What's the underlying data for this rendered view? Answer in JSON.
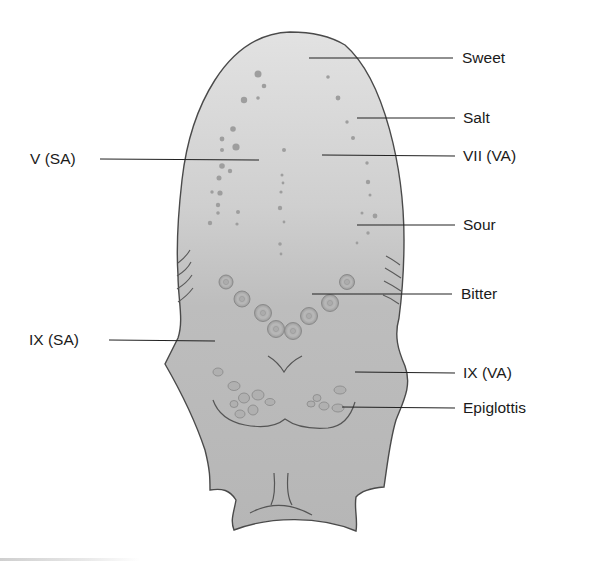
{
  "figure": {
    "fill_color": "#bdbdbd",
    "tip_fill_color": "#dedede",
    "outline_color": "#4a4a4a",
    "leader_color": "#222222"
  },
  "labels": {
    "sweet": "Sweet",
    "salt": "Salt",
    "v_sa": "V (SA)",
    "vii_va": "VII (VA)",
    "sour": "Sour",
    "bitter": "Bitter",
    "ix_sa": "IX (SA)",
    "ix_va": "IX (VA)",
    "epiglottis": "Epiglottis"
  }
}
